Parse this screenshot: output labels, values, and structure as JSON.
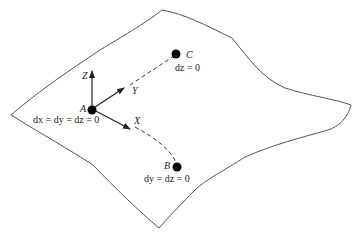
{
  "diagram": {
    "surface": {
      "stroke": "#555555"
    },
    "origin": {
      "label": "A",
      "constraint": "dx = dy = dz = 0"
    },
    "axes": [
      {
        "label": "Z"
      },
      {
        "label": "Y"
      },
      {
        "label": "X"
      }
    ],
    "points": [
      {
        "label": "C",
        "constraint": "dz = 0"
      },
      {
        "label": "B",
        "constraint": "dy = dz = 0"
      }
    ]
  }
}
